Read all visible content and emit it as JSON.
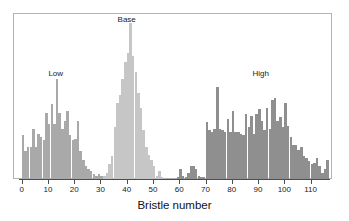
{
  "chart_data": {
    "type": "bar",
    "title": "",
    "subtitle": "",
    "xlabel": "Bristle number",
    "ylabel": "",
    "xlim": [
      -1,
      117
    ],
    "ylim": [
      0,
      100
    ],
    "grid": false,
    "legend_position": "none",
    "bin_width": 1,
    "annotations": [
      {
        "text": "Low",
        "x": 13,
        "y": 62,
        "series": "Low"
      },
      {
        "text": "Base",
        "x": 40,
        "y": 95,
        "series": "Base"
      },
      {
        "text": "High",
        "x": 91,
        "y": 62,
        "series": "High"
      }
    ],
    "xticks": [
      0,
      10,
      20,
      30,
      40,
      50,
      60,
      70,
      80,
      90,
      100,
      110
    ],
    "xticklabels": [
      "0",
      "10",
      "20",
      "30",
      "40",
      "50",
      "60",
      "70",
      "80",
      "90",
      "100",
      "110"
    ],
    "colors": {
      "Low": "#a9a9a9",
      "Base": "#c6c6c6",
      "High": "#8f8f8f",
      "frame": "#b3b3b3",
      "axis": "#4d4d4d",
      "text": "#1a1a1a",
      "background": "#ffffff"
    },
    "series": [
      {
        "name": "Low",
        "color": "#a9a9a9",
        "x": [
          0,
          1,
          2,
          3,
          4,
          5,
          6,
          7,
          8,
          9,
          10,
          11,
          12,
          13,
          14,
          15,
          16,
          17,
          18,
          19,
          20,
          21,
          22,
          23,
          24,
          25,
          26,
          27,
          28,
          29,
          30,
          31
        ],
        "values": [
          27,
          17,
          20,
          20,
          31,
          20,
          28,
          26,
          24,
          41,
          34,
          46,
          34,
          62,
          41,
          31,
          36,
          42,
          27,
          24,
          25,
          36,
          17,
          12,
          8,
          6,
          5,
          3,
          2,
          3,
          2,
          1
        ]
      },
      {
        "name": "Base",
        "color": "#c6c6c6",
        "x": [
          31,
          32,
          33,
          34,
          35,
          36,
          37,
          38,
          39,
          40,
          41,
          42,
          43,
          44,
          45,
          46,
          47,
          48,
          49,
          50,
          51,
          52,
          53
        ],
        "values": [
          2,
          4,
          9,
          14,
          32,
          47,
          52,
          62,
          72,
          78,
          96,
          76,
          66,
          53,
          44,
          30,
          20,
          15,
          12,
          8,
          2,
          5,
          1
        ]
      },
      {
        "name": "Sparse",
        "color": "#8f8f8f",
        "x": [
          59,
          60,
          61,
          62,
          63,
          64,
          65,
          66,
          67,
          68,
          69
        ],
        "values": [
          1,
          6,
          2,
          1,
          4,
          8,
          8,
          6,
          2,
          1,
          1
        ]
      },
      {
        "name": "High",
        "color": "#8f8f8f",
        "x": [
          70,
          71,
          72,
          73,
          74,
          75,
          76,
          77,
          78,
          79,
          80,
          81,
          82,
          83,
          84,
          85,
          86,
          87,
          88,
          89,
          90,
          91,
          92,
          93,
          94,
          95,
          96,
          97,
          98,
          99,
          100,
          101,
          102,
          103,
          104,
          105,
          106,
          107,
          108,
          109,
          110,
          111,
          112,
          113,
          114,
          115,
          116
        ],
        "values": [
          35,
          30,
          29,
          31,
          57,
          31,
          30,
          29,
          37,
          29,
          42,
          29,
          29,
          28,
          27,
          40,
          32,
          39,
          28,
          40,
          43,
          36,
          30,
          44,
          31,
          49,
          50,
          36,
          38,
          32,
          47,
          33,
          26,
          21,
          21,
          18,
          20,
          14,
          13,
          11,
          9,
          10,
          13,
          8,
          4,
          6,
          12
        ]
      }
    ]
  }
}
